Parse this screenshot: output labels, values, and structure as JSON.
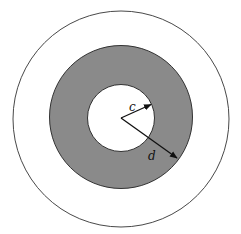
{
  "diagram": {
    "title": "",
    "colors": {
      "background": "#ffffff",
      "outer_stroke": "#333333",
      "annulus_fill": "#8a8a8a",
      "annulus_stroke": "#222222",
      "inner_fill": "#ffffff",
      "arrow": "#111111",
      "label": "#111111"
    },
    "labels": {
      "inner_radius": "c",
      "outer_radius": "d"
    }
  }
}
